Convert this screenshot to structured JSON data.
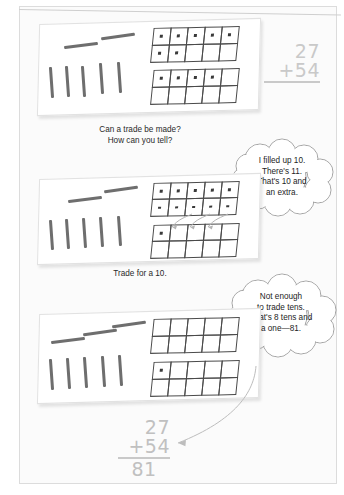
{
  "document": {
    "title": "Regrouping with base-ten blocks: 27 + 54",
    "type": "math-worksheet"
  },
  "problem": {
    "addend1": "27",
    "addend2": "+54",
    "sum": "81"
  },
  "panels": [
    {
      "id": "panel-1",
      "label": "initial-model",
      "tens_horizontal": 2,
      "tens_vertical": 5,
      "frame_top_filled": 7,
      "frame_bottom_filled": 4,
      "sum_display": {
        "addend1": "27",
        "addend2": "+54"
      }
    },
    {
      "id": "panel-2",
      "label": "trade-step",
      "tens_horizontal": 2,
      "tens_vertical": 5,
      "frame_top_filled": 10,
      "frame_bottom_filled": 1,
      "trade_arrows": 3
    },
    {
      "id": "panel-3",
      "label": "after-trade",
      "tens_horizontal": 3,
      "tens_vertical": 5,
      "frame_top_filled": 0,
      "frame_bottom_filled": 1
    }
  ],
  "prompts": [
    {
      "id": "prompt-1",
      "text": "Can a trade be made?\nHow can you tell?"
    },
    {
      "id": "prompt-2",
      "text": "Trade for a 10."
    }
  ],
  "bubbles": [
    {
      "id": "bubble-1",
      "text": "I filled up 10.\nThere's 11.\nThat's 10 and\nan extra."
    },
    {
      "id": "bubble-2",
      "text": "Not enough\nto trade tens.\nThat's 8 tens and\na one—81."
    }
  ],
  "final_answer": {
    "addend1": "27",
    "addend2": "+54",
    "total": "81"
  },
  "colors": {
    "page_background": "#fbfbfb",
    "mat": "#ffffff",
    "stick": "#6e6e6e",
    "frame_line": "#4a4a4a",
    "dot": "#3a3a3a",
    "text": "#1d1d1d",
    "handwriting": "#c9c9c9",
    "bubble_outline": "#9a9a9a",
    "arrow": "#b0b0b0"
  }
}
